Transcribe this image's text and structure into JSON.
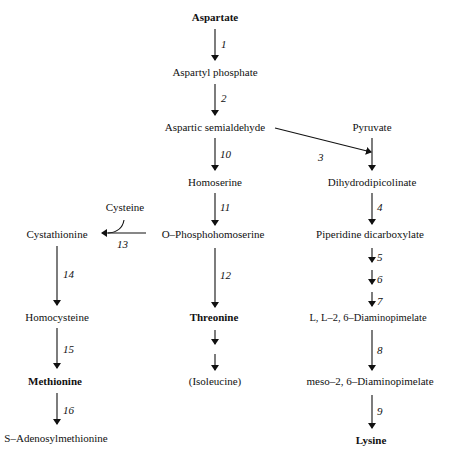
{
  "diagram": {
    "nodes": {
      "aspartate": "Aspartate",
      "aspartyl_phosphate": "Aspartyl phosphate",
      "aspartic_semialdehyde": "Aspartic semialdehyde",
      "pyruvate": "Pyruvate",
      "homoserine": "Homoserine",
      "dihydrodipicolinate": "Dihydrodipicolinate",
      "cysteine": "Cysteine",
      "cystathionine": "Cystathionine",
      "o_phosphohomoserine": "O–Phosphohomoserine",
      "piperidine_dicarboxylate": "Piperidine dicarboxylate",
      "homocysteine": "Homocysteine",
      "threonine": "Threonine",
      "ll_diaminopimelate": "L, L–2, 6–Diaminopimelate",
      "methionine": "Methionine",
      "isoleucine": "(Isoleucine)",
      "meso_diaminopimelate": "meso–2, 6–Diaminopimelate",
      "s_adenosylmethionine": "S–Adenosylmethionine",
      "lysine": "Lysine"
    },
    "steps": {
      "s1": "1",
      "s2": "2",
      "s3": "3",
      "s4": "4",
      "s5": "5",
      "s6": "6",
      "s7": "7",
      "s8": "8",
      "s9": "9",
      "s10": "10",
      "s11": "11",
      "s12": "12",
      "s13": "13",
      "s14": "14",
      "s15": "15",
      "s16": "16"
    }
  }
}
